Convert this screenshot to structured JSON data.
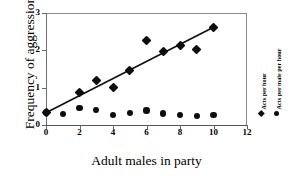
{
  "chart_data": {
    "type": "scatter",
    "title": "",
    "xlabel": "Adult males in party",
    "ylabel": "Frequency of aggression",
    "xlim": [
      0,
      12
    ],
    "ylim": [
      0,
      3
    ],
    "xticks": [
      0,
      2,
      4,
      6,
      8,
      10,
      12
    ],
    "xtick_labels": [
      "0",
      "2",
      "4",
      "6",
      "8",
      "10",
      "12"
    ],
    "yticks": [
      0,
      1,
      2,
      3
    ],
    "ytick_labels": [
      "0",
      "1",
      "2",
      "3"
    ],
    "grid": false,
    "legend_position": "right-outside",
    "series": [
      {
        "name": "Acts per hour",
        "marker": "diamond",
        "color": "#0d0d0d",
        "points": [
          {
            "x": 0,
            "y": 0.33
          },
          {
            "x": 2,
            "y": 0.88
          },
          {
            "x": 3,
            "y": 1.18
          },
          {
            "x": 4,
            "y": 1.01
          },
          {
            "x": 5,
            "y": 1.47
          },
          {
            "x": 6,
            "y": 2.26
          },
          {
            "x": 7,
            "y": 1.97
          },
          {
            "x": 8,
            "y": 2.12
          },
          {
            "x": 9,
            "y": 2.01
          },
          {
            "x": 10,
            "y": 2.62
          }
        ]
      },
      {
        "name": "Acts per male per hour",
        "marker": "circle",
        "color": "#0d0d0d",
        "points": [
          {
            "x": 0,
            "y": 0.33
          },
          {
            "x": 1,
            "y": 0.29
          },
          {
            "x": 2,
            "y": 0.45
          },
          {
            "x": 3,
            "y": 0.41
          },
          {
            "x": 4,
            "y": 0.26
          },
          {
            "x": 5,
            "y": 0.32
          },
          {
            "x": 6,
            "y": 0.39
          },
          {
            "x": 7,
            "y": 0.31
          },
          {
            "x": 8,
            "y": 0.27
          },
          {
            "x": 9,
            "y": 0.24
          },
          {
            "x": 10,
            "y": 0.27
          }
        ]
      }
    ],
    "trendline": {
      "name": "regression-line",
      "x_start": 0,
      "y_start": 0.33,
      "x_end": 10,
      "y_end": 2.62,
      "color": "#111111"
    }
  }
}
